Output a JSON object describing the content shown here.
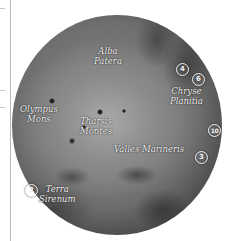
{
  "map": {
    "subject": "Mars globe",
    "labels": [
      {
        "id": "alba-patera",
        "line1": "Alba",
        "line2": "Patera"
      },
      {
        "id": "chryse-planitia",
        "line1": "Chryse",
        "line2": "Planitia"
      },
      {
        "id": "olympus-mons",
        "line1": "Olympus",
        "line2": "Mons"
      },
      {
        "id": "tharsis-montes",
        "line1": "Tharsis",
        "line2": "Montes"
      },
      {
        "id": "valles-marineris",
        "line1": "Valles Marineris"
      },
      {
        "id": "terra-sirenum",
        "line1": "Terra",
        "line2": "Sirenum"
      }
    ],
    "markers": [
      {
        "number": "4"
      },
      {
        "number": "6"
      },
      {
        "number": "10"
      },
      {
        "number": "3"
      },
      {
        "number": "2"
      }
    ]
  }
}
